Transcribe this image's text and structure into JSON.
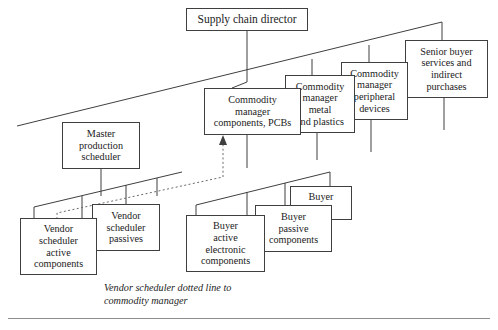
{
  "diagram": {
    "title_box": {
      "label": "Supply chain director",
      "x": 186,
      "y": 8,
      "w": 122,
      "h": 23,
      "font": 11.5
    },
    "boxes": [
      {
        "name": "commodity-manager-components-pcbs",
        "label": "Commodity\nmanager\ncomponents, PCBs",
        "x": 204,
        "y": 88,
        "w": 97,
        "h": 47,
        "font": 10.2,
        "z": 5
      },
      {
        "name": "commodity-manager-metal-plastics",
        "label": "Commodity\nmanager\nmetal\nand plastics",
        "x": 285,
        "y": 75,
        "w": 70,
        "h": 58,
        "font": 10.2,
        "z": 4
      },
      {
        "name": "commodity-manager-peripheral-devices",
        "label": "Commodity\nmanager\nperipheral\ndevices",
        "x": 341,
        "y": 62,
        "w": 67,
        "h": 58,
        "font": 10.2,
        "z": 3
      },
      {
        "name": "senior-buyer-services-indirect-purchases",
        "label": "Senior buyer\nservices and\nindirect\npurchases",
        "x": 405,
        "y": 40,
        "w": 83,
        "h": 58,
        "font": 10.2,
        "z": 2
      },
      {
        "name": "master-production-scheduler",
        "label": "Master\nproduction\nscheduler",
        "x": 62,
        "y": 122,
        "w": 78,
        "h": 47,
        "font": 10.2,
        "z": 5
      },
      {
        "name": "vendor-scheduler-active-components",
        "label": "Vendor\nscheduler\nactive\ncomponents",
        "x": 20,
        "y": 218,
        "w": 77,
        "h": 57,
        "font": 10.2,
        "z": 5
      },
      {
        "name": "vendor-scheduler-passives",
        "label": "Vendor\nscheduler\npassives",
        "x": 92,
        "y": 204,
        "w": 68,
        "h": 47,
        "font": 10.2,
        "z": 4
      },
      {
        "name": "buyer-active-electronic-components",
        "label": "Buyer\nactive\nelectronic\ncomponents",
        "x": 186,
        "y": 215,
        "w": 79,
        "h": 57,
        "font": 10.2,
        "z": 5
      },
      {
        "name": "buyer-passive-components",
        "label": "Buyer\npassive\ncomponents",
        "x": 255,
        "y": 205,
        "w": 77,
        "h": 47,
        "font": 10.2,
        "z": 4
      },
      {
        "name": "buyer-cbs",
        "label": "Buyer\nCBs",
        "x": 290,
        "y": 186,
        "w": 62,
        "h": 34,
        "font": 10.2,
        "z": 3
      }
    ],
    "caption": {
      "text": "Vendor scheduler dotted line to\ncommodity manager",
      "x": 104,
      "y": 281,
      "font": 10.2
    },
    "bottom_rule": {
      "x": 8,
      "y": 318,
      "w": 482,
      "h": 1
    },
    "stroke_color": "#3f3f3f",
    "rule_color": "#8d8d8d"
  }
}
